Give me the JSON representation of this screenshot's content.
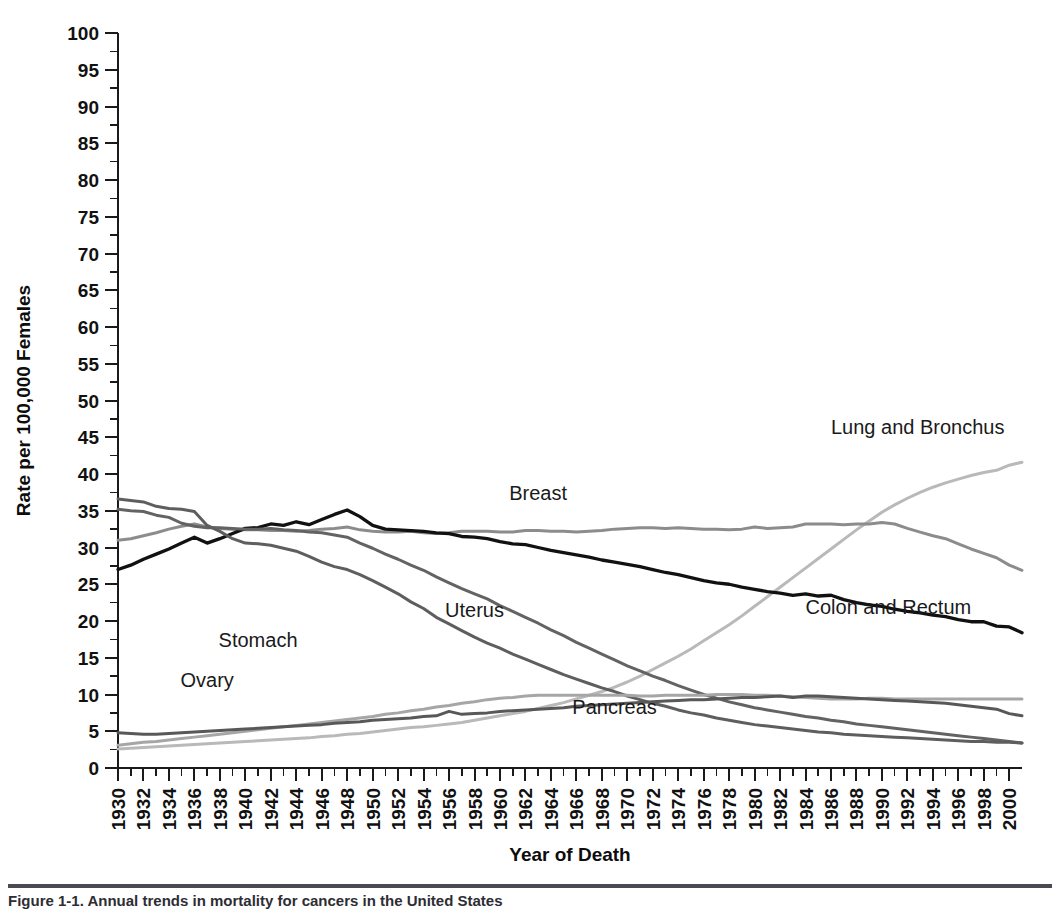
{
  "figure": {
    "caption": "Figure 1-1. Annual  trends in mortality for cancers in the United States",
    "background": "#ffffff"
  },
  "chart_data": {
    "type": "line",
    "title": "",
    "xlabel": "Year of Death",
    "ylabel": "Rate per 100,000 Females",
    "xlim": [
      1930,
      2001
    ],
    "ylim": [
      0,
      100
    ],
    "xtick_step": 2,
    "ytick_step": 5,
    "y_minor_step": 2.5,
    "x_minor_step": 1,
    "grid": false,
    "legend": "inline-annotations",
    "xticks": [
      1930,
      1932,
      1934,
      1936,
      1938,
      1940,
      1942,
      1944,
      1946,
      1948,
      1950,
      1952,
      1954,
      1956,
      1958,
      1960,
      1962,
      1964,
      1966,
      1968,
      1970,
      1972,
      1974,
      1976,
      1978,
      1980,
      1982,
      1984,
      1986,
      1988,
      1990,
      1992,
      1994,
      1996,
      1998,
      2000
    ],
    "yticks": [
      0,
      5,
      10,
      15,
      20,
      25,
      30,
      35,
      40,
      45,
      50,
      55,
      60,
      65,
      70,
      75,
      80,
      85,
      90,
      95,
      100
    ],
    "x": [
      1930,
      1931,
      1932,
      1933,
      1934,
      1935,
      1936,
      1937,
      1938,
      1939,
      1940,
      1941,
      1942,
      1943,
      1944,
      1945,
      1946,
      1947,
      1948,
      1949,
      1950,
      1951,
      1952,
      1953,
      1954,
      1955,
      1956,
      1957,
      1958,
      1959,
      1960,
      1961,
      1962,
      1963,
      1964,
      1965,
      1966,
      1967,
      1968,
      1969,
      1970,
      1971,
      1972,
      1973,
      1974,
      1975,
      1976,
      1977,
      1978,
      1979,
      1980,
      1981,
      1982,
      1983,
      1984,
      1985,
      1986,
      1987,
      1988,
      1989,
      1990,
      1991,
      1992,
      1993,
      1994,
      1995,
      1996,
      1997,
      1998,
      1999,
      2000,
      2001
    ],
    "series": [
      {
        "name": "Lung and Bronchus",
        "color": "#b9b9b9",
        "width": 3.0,
        "label_x": 1986,
        "label_y": 45.5,
        "values": [
          2.6,
          2.7,
          2.8,
          2.9,
          3.0,
          3.1,
          3.2,
          3.3,
          3.4,
          3.5,
          3.6,
          3.7,
          3.8,
          3.9,
          4.0,
          4.1,
          4.3,
          4.4,
          4.6,
          4.7,
          4.9,
          5.1,
          5.3,
          5.5,
          5.6,
          5.8,
          6.0,
          6.2,
          6.5,
          6.8,
          7.1,
          7.4,
          7.7,
          8.1,
          8.5,
          8.9,
          9.4,
          9.9,
          10.4,
          11.0,
          11.7,
          12.5,
          13.4,
          14.3,
          15.2,
          16.2,
          17.3,
          18.4,
          19.5,
          20.7,
          22.0,
          23.3,
          24.6,
          25.9,
          27.2,
          28.5,
          29.8,
          31.1,
          32.4,
          33.6,
          34.8,
          35.8,
          36.7,
          37.5,
          38.2,
          38.8,
          39.3,
          39.8,
          40.2,
          40.5,
          41.2,
          41.6
        ]
      },
      {
        "name": "Breast",
        "color": "#8c8c8c",
        "width": 3.0,
        "label_x": 1963,
        "label_y": 36.5,
        "values": [
          31.0,
          31.2,
          31.6,
          32.0,
          32.5,
          32.9,
          33.2,
          32.8,
          32.6,
          32.5,
          32.4,
          32.4,
          32.3,
          32.3,
          32.2,
          32.3,
          32.5,
          32.6,
          32.8,
          32.4,
          32.2,
          32.1,
          32.1,
          32.2,
          32.0,
          31.9,
          32.0,
          32.2,
          32.2,
          32.2,
          32.1,
          32.1,
          32.3,
          32.3,
          32.2,
          32.2,
          32.1,
          32.2,
          32.3,
          32.5,
          32.6,
          32.7,
          32.7,
          32.6,
          32.7,
          32.6,
          32.5,
          32.5,
          32.4,
          32.5,
          32.8,
          32.6,
          32.7,
          32.8,
          33.2,
          33.2,
          33.2,
          33.1,
          33.2,
          33.2,
          33.4,
          33.2,
          32.6,
          32.1,
          31.6,
          31.2,
          30.5,
          29.8,
          29.2,
          28.6,
          27.6,
          26.9
        ]
      },
      {
        "name": "Colon and Rectum",
        "color": "#111111",
        "width": 3.3,
        "label_x": 1984,
        "label_y": 21.0,
        "values": [
          27.0,
          27.6,
          28.4,
          29.1,
          29.8,
          30.6,
          31.4,
          30.6,
          31.2,
          31.9,
          32.6,
          32.7,
          33.2,
          33.0,
          33.5,
          33.1,
          33.8,
          34.5,
          35.1,
          34.2,
          33.0,
          32.5,
          32.4,
          32.3,
          32.2,
          32.0,
          31.9,
          31.5,
          31.4,
          31.2,
          30.8,
          30.5,
          30.4,
          30.0,
          29.6,
          29.3,
          29.0,
          28.7,
          28.3,
          28.0,
          27.7,
          27.4,
          27.0,
          26.6,
          26.3,
          25.9,
          25.5,
          25.2,
          25.0,
          24.6,
          24.3,
          24.0,
          23.8,
          23.5,
          23.7,
          23.4,
          23.5,
          22.9,
          22.5,
          22.2,
          22.0,
          21.6,
          21.3,
          21.1,
          20.8,
          20.6,
          20.2,
          19.9,
          19.9,
          19.3,
          19.2,
          18.4
        ]
      },
      {
        "name": "Uterus",
        "color": "#636363",
        "width": 3.0,
        "label_x": 1958,
        "label_y": 20.5,
        "values": [
          35.2,
          35.0,
          34.9,
          34.4,
          34.1,
          33.3,
          32.9,
          32.7,
          32.7,
          32.6,
          32.5,
          32.5,
          32.6,
          32.4,
          32.3,
          32.1,
          32.0,
          31.7,
          31.4,
          30.6,
          29.9,
          29.1,
          28.4,
          27.6,
          26.9,
          26.0,
          25.2,
          24.4,
          23.7,
          23.0,
          22.1,
          21.3,
          20.5,
          19.7,
          18.8,
          18.0,
          17.1,
          16.3,
          15.5,
          14.7,
          13.9,
          13.2,
          12.5,
          11.9,
          11.2,
          10.6,
          10.0,
          9.5,
          9.0,
          8.6,
          8.2,
          7.9,
          7.6,
          7.3,
          7.0,
          6.8,
          6.5,
          6.3,
          6.0,
          5.8,
          5.6,
          5.4,
          5.2,
          5.0,
          4.8,
          4.6,
          4.4,
          4.2,
          4.0,
          3.8,
          3.6,
          3.4
        ]
      },
      {
        "name": "Stomach",
        "color": "#5e5e5e",
        "width": 3.0,
        "label_x": 1941,
        "label_y": 16.5,
        "values": [
          36.6,
          36.4,
          36.2,
          35.6,
          35.3,
          35.2,
          34.9,
          33.0,
          32.2,
          31.2,
          30.6,
          30.5,
          30.3,
          29.9,
          29.5,
          28.8,
          28.0,
          27.4,
          27.0,
          26.3,
          25.5,
          24.6,
          23.7,
          22.6,
          21.7,
          20.5,
          19.6,
          18.7,
          17.8,
          17.0,
          16.3,
          15.5,
          14.8,
          14.1,
          13.4,
          12.7,
          12.1,
          11.5,
          10.9,
          10.4,
          9.8,
          9.3,
          8.8,
          8.4,
          7.9,
          7.5,
          7.2,
          6.8,
          6.5,
          6.2,
          5.9,
          5.7,
          5.5,
          5.3,
          5.1,
          4.9,
          4.8,
          4.6,
          4.5,
          4.4,
          4.3,
          4.2,
          4.1,
          4.0,
          3.9,
          3.8,
          3.7,
          3.6,
          3.6,
          3.5,
          3.5,
          3.4
        ]
      },
      {
        "name": "Ovary",
        "color": "#a6a6a6",
        "width": 3.0,
        "label_x": 1937,
        "label_y": 11.0,
        "values": [
          3.1,
          3.3,
          3.5,
          3.6,
          3.8,
          4.0,
          4.2,
          4.4,
          4.6,
          4.8,
          5.0,
          5.2,
          5.4,
          5.6,
          5.8,
          6.0,
          6.2,
          6.4,
          6.6,
          6.8,
          7.0,
          7.3,
          7.5,
          7.8,
          8.0,
          8.3,
          8.5,
          8.8,
          9.0,
          9.3,
          9.5,
          9.6,
          9.8,
          9.9,
          9.9,
          9.9,
          9.9,
          9.9,
          9.9,
          9.9,
          9.9,
          9.8,
          9.8,
          9.9,
          9.9,
          9.9,
          9.9,
          10.0,
          10.0,
          10.0,
          9.9,
          9.9,
          9.8,
          9.7,
          9.6,
          9.5,
          9.4,
          9.4,
          9.4,
          9.5,
          9.5,
          9.4,
          9.4,
          9.4,
          9.4,
          9.4,
          9.4,
          9.4,
          9.4,
          9.4,
          9.4,
          9.4
        ]
      },
      {
        "name": "Pancreas",
        "color": "#585858",
        "width": 3.0,
        "label_x": 1969,
        "label_y": 7.3,
        "values": [
          4.8,
          4.7,
          4.6,
          4.6,
          4.7,
          4.8,
          4.9,
          5.0,
          5.1,
          5.2,
          5.3,
          5.4,
          5.5,
          5.6,
          5.7,
          5.8,
          5.9,
          6.1,
          6.2,
          6.3,
          6.5,
          6.6,
          6.7,
          6.8,
          7.0,
          7.1,
          7.7,
          7.3,
          7.4,
          7.5,
          7.7,
          7.8,
          7.9,
          8.0,
          8.1,
          8.2,
          8.4,
          8.5,
          8.6,
          8.7,
          8.8,
          8.9,
          9.0,
          9.1,
          9.2,
          9.3,
          9.3,
          9.4,
          9.5,
          9.6,
          9.6,
          9.7,
          9.8,
          9.6,
          9.8,
          9.8,
          9.7,
          9.6,
          9.5,
          9.4,
          9.3,
          9.2,
          9.1,
          9.0,
          8.9,
          8.8,
          8.6,
          8.4,
          8.2,
          8.0,
          7.4,
          7.1
        ]
      }
    ]
  }
}
